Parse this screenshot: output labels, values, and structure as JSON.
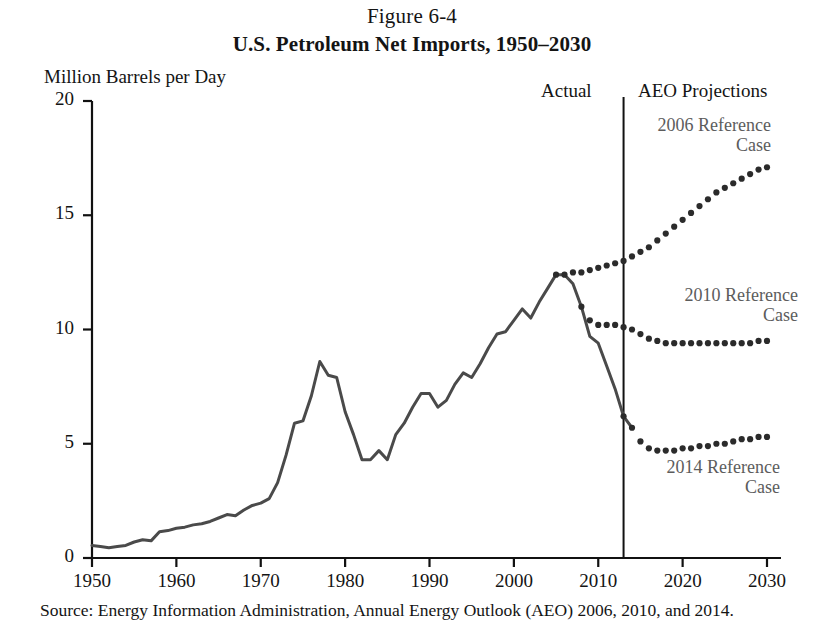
{
  "figure": {
    "number": "Figure 6-4",
    "title": "U.S. Petroleum Net Imports, 1950–2030",
    "unit_label": "Million Barrels per Day",
    "actual_label": "Actual",
    "projections_label": "AEO Projections",
    "source": "Source: Energy Information Administration, Annual Energy Outlook (AEO) 2006, 2010, and 2014."
  },
  "annotations": [
    {
      "id": "ref-2006",
      "line1": "2006 Reference",
      "line2": "Case",
      "text": "2006 Reference\nCase"
    },
    {
      "id": "ref-2010",
      "line1": "2010 Reference",
      "line2": "Case",
      "text": "2010 Reference\nCase"
    },
    {
      "id": "ref-2014",
      "line1": "2014 Reference",
      "line2": "Case",
      "text": "2014 Reference\nCase"
    }
  ],
  "axis": {
    "y_ticks": [
      "0",
      "5",
      "10",
      "15",
      "20"
    ],
    "x_ticks": [
      "1950",
      "1960",
      "1970",
      "1980",
      "1990",
      "2000",
      "2010",
      "2020",
      "2030"
    ]
  },
  "colors": {
    "actual_line": "#4a4a4a",
    "projection_dots": "#2b2b2b",
    "annotation_text": "#5c5c5c",
    "axis": "#111111",
    "background": "#ffffff"
  },
  "chart_data": {
    "type": "line",
    "title": "U.S. Petroleum Net Imports, 1950–2030",
    "subtitle": "Figure 6-4",
    "xlabel": "",
    "ylabel": "Million Barrels per Day",
    "xlim": [
      1950,
      2030
    ],
    "ylim": [
      0,
      20
    ],
    "yticks": [
      0,
      5,
      10,
      15,
      20
    ],
    "xticks": [
      1950,
      1960,
      1970,
      1980,
      1990,
      2000,
      2010,
      2020,
      2030
    ],
    "grid": false,
    "legend": "annotations-inline",
    "divider_x": 2013,
    "divider_label_left": "Actual",
    "divider_label_right": "AEO Projections",
    "series": [
      {
        "name": "Actual",
        "style": "solid",
        "color": "#4a4a4a",
        "x": [
          1950,
          1951,
          1952,
          1953,
          1954,
          1955,
          1956,
          1957,
          1958,
          1959,
          1960,
          1961,
          1962,
          1963,
          1964,
          1965,
          1966,
          1967,
          1968,
          1969,
          1970,
          1971,
          1972,
          1973,
          1974,
          1975,
          1976,
          1977,
          1978,
          1979,
          1980,
          1981,
          1982,
          1983,
          1984,
          1985,
          1986,
          1987,
          1988,
          1989,
          1990,
          1991,
          1992,
          1993,
          1994,
          1995,
          1996,
          1997,
          1998,
          1999,
          2000,
          2001,
          2002,
          2003,
          2004,
          2005,
          2006,
          2007,
          2008,
          2009,
          2010,
          2011,
          2012,
          2013,
          2014
        ],
        "y": [
          0.55,
          0.5,
          0.45,
          0.5,
          0.55,
          0.7,
          0.8,
          0.75,
          1.15,
          1.2,
          1.3,
          1.35,
          1.45,
          1.5,
          1.6,
          1.75,
          1.9,
          1.85,
          2.1,
          2.3,
          2.4,
          2.6,
          3.3,
          4.5,
          5.9,
          6.0,
          7.1,
          8.6,
          8.0,
          7.9,
          6.4,
          5.4,
          4.3,
          4.3,
          4.7,
          4.3,
          5.4,
          5.9,
          6.6,
          7.2,
          7.2,
          6.6,
          6.9,
          7.6,
          8.1,
          7.9,
          8.5,
          9.2,
          9.8,
          9.9,
          10.4,
          10.9,
          10.5,
          11.2,
          11.8,
          12.4,
          12.4,
          12.0,
          11.0,
          9.7,
          9.4,
          8.4,
          7.4,
          6.2,
          5.7
        ]
      },
      {
        "name": "2006 Reference Case",
        "style": "dotted",
        "color": "#2b2b2b",
        "x": [
          2005,
          2006,
          2007,
          2008,
          2009,
          2010,
          2011,
          2012,
          2013,
          2014,
          2015,
          2016,
          2017,
          2018,
          2019,
          2020,
          2021,
          2022,
          2023,
          2024,
          2025,
          2026,
          2027,
          2028,
          2029,
          2030
        ],
        "y": [
          12.4,
          12.4,
          12.5,
          12.5,
          12.6,
          12.7,
          12.8,
          12.9,
          13.0,
          13.2,
          13.4,
          13.6,
          13.9,
          14.2,
          14.5,
          14.8,
          15.1,
          15.4,
          15.7,
          16.0,
          16.2,
          16.4,
          16.6,
          16.8,
          17.0,
          17.1
        ]
      },
      {
        "name": "2010 Reference Case",
        "style": "dotted",
        "color": "#2b2b2b",
        "x": [
          2008,
          2009,
          2010,
          2011,
          2012,
          2013,
          2014,
          2015,
          2016,
          2017,
          2018,
          2019,
          2020,
          2021,
          2022,
          2023,
          2024,
          2025,
          2026,
          2027,
          2028,
          2029,
          2030
        ],
        "y": [
          11.0,
          10.4,
          10.2,
          10.2,
          10.2,
          10.1,
          10.0,
          9.8,
          9.6,
          9.5,
          9.4,
          9.4,
          9.4,
          9.4,
          9.4,
          9.4,
          9.4,
          9.4,
          9.4,
          9.4,
          9.4,
          9.5,
          9.5
        ]
      },
      {
        "name": "2014 Reference Case",
        "style": "dotted",
        "color": "#2b2b2b",
        "x": [
          2013,
          2014,
          2015,
          2016,
          2017,
          2018,
          2019,
          2020,
          2021,
          2022,
          2023,
          2024,
          2025,
          2026,
          2027,
          2028,
          2029,
          2030
        ],
        "y": [
          6.2,
          5.7,
          5.1,
          4.8,
          4.7,
          4.7,
          4.7,
          4.8,
          4.8,
          4.9,
          4.9,
          5.0,
          5.0,
          5.1,
          5.2,
          5.2,
          5.3,
          5.3
        ]
      }
    ]
  }
}
